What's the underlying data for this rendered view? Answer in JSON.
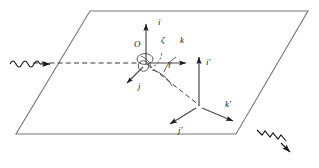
{
  "figure": {
    "stroke_color": "#555555",
    "vector_color": "#1a1a1a",
    "dash_color": "#3a3a3a",
    "background": "#ffffff"
  },
  "plane": {
    "name": "reference-plane",
    "points": "90,11 308,11 236,134 16,134"
  },
  "origin": {
    "label": "O",
    "x": 141,
    "y": 46
  },
  "angles": {
    "zeta": {
      "label": "ζ",
      "x": 162,
      "y": 41
    },
    "gamma": {
      "label": "γ",
      "x": 169,
      "y": 63
    }
  },
  "basis_unprimed": [
    {
      "label": "i",
      "x": 160,
      "y": 21,
      "axis": "i-axis-up"
    },
    {
      "label": "j",
      "x": 140,
      "y": 84,
      "axis": "j-axis-down-left"
    },
    {
      "label": "k",
      "x": 182,
      "y": 41,
      "axis": "k-axis-right"
    }
  ],
  "basis_primed": [
    {
      "label": "i",
      "prime": "′",
      "x": 208,
      "y": 63,
      "axis": "i-prime-axis-up"
    },
    {
      "label": "j",
      "prime": "′",
      "x": 180,
      "y": 130,
      "axis": "j-prime-axis-down-left"
    },
    {
      "label": "k",
      "prime": "′",
      "x": 227,
      "y": 104,
      "axis": "k-prime-axis-down-right"
    }
  ],
  "waves": {
    "incoming": {
      "name": "incoming-wave-arrow",
      "x": 14,
      "y": 63,
      "direction": "right"
    },
    "outgoing": {
      "name": "outgoing-wave-arrow",
      "x": 262,
      "y": 133,
      "direction": "down-right"
    }
  }
}
